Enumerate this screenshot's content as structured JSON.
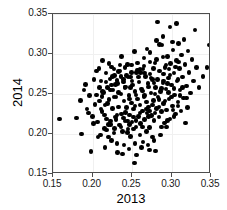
{
  "chart_data": {
    "type": "scatter",
    "title": "",
    "xlabel": "2013",
    "ylabel": "2014",
    "xlim": [
      0.15,
      0.35
    ],
    "ylim": [
      0.15,
      0.35
    ],
    "xticks": [
      "0.15",
      "0.20",
      "0.25",
      "0.30",
      "0.35"
    ],
    "yticks": [
      "0.15",
      "0.20",
      "0.25",
      "0.30",
      "0.35"
    ],
    "xtick_values": [
      0.15,
      0.2,
      0.25,
      0.3,
      0.35
    ],
    "ytick_values": [
      0.15,
      0.2,
      0.25,
      0.3,
      0.35
    ],
    "grid": true,
    "legend": null,
    "marker": "filled-circle",
    "marker_color": "#000000",
    "n_points": 268,
    "points": [
      [
        0.158,
        0.219
      ],
      [
        0.178,
        0.149
      ],
      [
        0.18,
        0.22
      ],
      [
        0.186,
        0.2
      ],
      [
        0.191,
        0.262
      ],
      [
        0.193,
        0.231
      ],
      [
        0.195,
        0.226
      ],
      [
        0.198,
        0.178
      ],
      [
        0.2,
        0.222
      ],
      [
        0.201,
        0.213
      ],
      [
        0.203,
        0.237
      ],
      [
        0.205,
        0.249
      ],
      [
        0.207,
        0.196
      ],
      [
        0.208,
        0.282
      ],
      [
        0.209,
        0.241
      ],
      [
        0.21,
        0.199
      ],
      [
        0.211,
        0.266
      ],
      [
        0.212,
        0.228
      ],
      [
        0.213,
        0.292
      ],
      [
        0.214,
        0.252
      ],
      [
        0.215,
        0.207
      ],
      [
        0.216,
        0.236
      ],
      [
        0.217,
        0.276
      ],
      [
        0.218,
        0.219
      ],
      [
        0.219,
        0.258
      ],
      [
        0.22,
        0.196
      ],
      [
        0.221,
        0.243
      ],
      [
        0.222,
        0.269
      ],
      [
        0.223,
        0.212
      ],
      [
        0.224,
        0.284
      ],
      [
        0.225,
        0.232
      ],
      [
        0.226,
        0.255
      ],
      [
        0.227,
        0.201
      ],
      [
        0.228,
        0.273
      ],
      [
        0.229,
        0.221
      ],
      [
        0.23,
        0.246
      ],
      [
        0.231,
        0.188
      ],
      [
        0.232,
        0.263
      ],
      [
        0.233,
        0.234
      ],
      [
        0.234,
        0.211
      ],
      [
        0.235,
        0.279
      ],
      [
        0.236,
        0.25
      ],
      [
        0.237,
        0.225
      ],
      [
        0.238,
        0.203
      ],
      [
        0.239,
        0.268
      ],
      [
        0.24,
        0.241
      ],
      [
        0.241,
        0.216
      ],
      [
        0.242,
        0.259
      ],
      [
        0.243,
        0.233
      ],
      [
        0.244,
        0.287
      ],
      [
        0.245,
        0.206
      ],
      [
        0.246,
        0.248
      ],
      [
        0.247,
        0.224
      ],
      [
        0.248,
        0.271
      ],
      [
        0.249,
        0.239
      ],
      [
        0.25,
        0.215
      ],
      [
        0.251,
        0.261
      ],
      [
        0.252,
        0.231
      ],
      [
        0.253,
        0.164
      ],
      [
        0.254,
        0.253
      ],
      [
        0.255,
        0.209
      ],
      [
        0.256,
        0.277
      ],
      [
        0.257,
        0.244
      ],
      [
        0.258,
        0.222
      ],
      [
        0.259,
        0.265
      ],
      [
        0.26,
        0.236
      ],
      [
        0.261,
        0.213
      ],
      [
        0.262,
        0.256
      ],
      [
        0.263,
        0.229
      ],
      [
        0.264,
        0.281
      ],
      [
        0.265,
        0.247
      ],
      [
        0.266,
        0.218
      ],
      [
        0.267,
        0.272
      ],
      [
        0.268,
        0.24
      ],
      [
        0.269,
        0.226
      ],
      [
        0.27,
        0.263
      ],
      [
        0.271,
        0.234
      ],
      [
        0.272,
        0.208
      ],
      [
        0.273,
        0.275
      ],
      [
        0.274,
        0.251
      ],
      [
        0.275,
        0.223
      ],
      [
        0.276,
        0.268
      ],
      [
        0.277,
        0.242
      ],
      [
        0.278,
        0.217
      ],
      [
        0.279,
        0.289
      ],
      [
        0.28,
        0.258
      ],
      [
        0.281,
        0.232
      ],
      [
        0.282,
        0.34
      ],
      [
        0.283,
        0.246
      ],
      [
        0.284,
        0.221
      ],
      [
        0.285,
        0.279
      ],
      [
        0.286,
        0.253
      ],
      [
        0.287,
        0.228
      ],
      [
        0.288,
        0.311
      ],
      [
        0.289,
        0.264
      ],
      [
        0.29,
        0.238
      ],
      [
        0.291,
        0.214
      ],
      [
        0.292,
        0.283
      ],
      [
        0.293,
        0.256
      ],
      [
        0.294,
        0.23
      ],
      [
        0.295,
        0.297
      ],
      [
        0.296,
        0.27
      ],
      [
        0.297,
        0.244
      ],
      [
        0.298,
        0.219
      ],
      [
        0.299,
        0.288
      ],
      [
        0.3,
        0.261
      ],
      [
        0.301,
        0.235
      ],
      [
        0.302,
        0.305
      ],
      [
        0.303,
        0.276
      ],
      [
        0.304,
        0.249
      ],
      [
        0.305,
        0.225
      ],
      [
        0.306,
        0.292
      ],
      [
        0.307,
        0.266
      ],
      [
        0.308,
        0.24
      ],
      [
        0.309,
        0.313
      ],
      [
        0.31,
        0.282
      ],
      [
        0.311,
        0.255
      ],
      [
        0.312,
        0.229
      ],
      [
        0.313,
        0.299
      ],
      [
        0.314,
        0.271
      ],
      [
        0.315,
        0.245
      ],
      [
        0.316,
        0.318
      ],
      [
        0.317,
        0.287
      ],
      [
        0.318,
        0.214
      ],
      [
        0.319,
        0.26
      ],
      [
        0.32,
        0.233
      ],
      [
        0.321,
        0.304
      ],
      [
        0.322,
        0.277
      ],
      [
        0.324,
        0.251
      ],
      [
        0.326,
        0.293
      ],
      [
        0.328,
        0.266
      ],
      [
        0.33,
        0.33
      ],
      [
        0.332,
        0.283
      ],
      [
        0.335,
        0.258
      ],
      [
        0.34,
        0.272
      ],
      [
        0.345,
        0.283
      ],
      [
        0.348,
        0.311
      ],
      [
        0.185,
        0.242
      ],
      [
        0.189,
        0.255
      ],
      [
        0.196,
        0.248
      ],
      [
        0.202,
        0.268
      ],
      [
        0.206,
        0.215
      ],
      [
        0.212,
        0.247
      ],
      [
        0.218,
        0.205
      ],
      [
        0.224,
        0.261
      ],
      [
        0.23,
        0.218
      ],
      [
        0.236,
        0.272
      ],
      [
        0.242,
        0.227
      ],
      [
        0.248,
        0.258
      ],
      [
        0.254,
        0.235
      ],
      [
        0.26,
        0.281
      ],
      [
        0.266,
        0.248
      ],
      [
        0.272,
        0.229
      ],
      [
        0.278,
        0.264
      ],
      [
        0.284,
        0.243
      ],
      [
        0.29,
        0.275
      ],
      [
        0.296,
        0.252
      ],
      [
        0.302,
        0.23
      ],
      [
        0.308,
        0.268
      ],
      [
        0.314,
        0.258
      ],
      [
        0.205,
        0.279
      ],
      [
        0.213,
        0.253
      ],
      [
        0.221,
        0.288
      ],
      [
        0.229,
        0.262
      ],
      [
        0.237,
        0.297
      ],
      [
        0.245,
        0.271
      ],
      [
        0.253,
        0.303
      ],
      [
        0.261,
        0.277
      ],
      [
        0.269,
        0.306
      ],
      [
        0.277,
        0.282
      ],
      [
        0.285,
        0.312
      ],
      [
        0.293,
        0.286
      ],
      [
        0.301,
        0.315
      ],
      [
        0.309,
        0.29
      ],
      [
        0.298,
        0.334
      ],
      [
        0.306,
        0.338
      ],
      [
        0.289,
        0.322
      ],
      [
        0.281,
        0.317
      ],
      [
        0.273,
        0.302
      ],
      [
        0.265,
        0.295
      ],
      [
        0.257,
        0.289
      ],
      [
        0.249,
        0.286
      ],
      [
        0.241,
        0.283
      ],
      [
        0.233,
        0.278
      ],
      [
        0.225,
        0.272
      ],
      [
        0.217,
        0.265
      ],
      [
        0.209,
        0.258
      ],
      [
        0.216,
        0.183
      ],
      [
        0.224,
        0.192
      ],
      [
        0.232,
        0.177
      ],
      [
        0.24,
        0.186
      ],
      [
        0.248,
        0.197
      ],
      [
        0.256,
        0.174
      ],
      [
        0.264,
        0.19
      ],
      [
        0.272,
        0.18
      ],
      [
        0.28,
        0.179
      ],
      [
        0.276,
        0.196
      ],
      [
        0.268,
        0.203
      ],
      [
        0.26,
        0.199
      ],
      [
        0.252,
        0.206
      ],
      [
        0.244,
        0.202
      ],
      [
        0.236,
        0.209
      ],
      [
        0.228,
        0.207
      ],
      [
        0.22,
        0.212
      ],
      [
        0.244,
        0.216
      ],
      [
        0.252,
        0.221
      ],
      [
        0.26,
        0.226
      ],
      [
        0.268,
        0.231
      ],
      [
        0.276,
        0.236
      ],
      [
        0.284,
        0.234
      ],
      [
        0.292,
        0.241
      ],
      [
        0.3,
        0.246
      ],
      [
        0.308,
        0.235
      ],
      [
        0.247,
        0.244
      ],
      [
        0.255,
        0.249
      ],
      [
        0.263,
        0.254
      ],
      [
        0.271,
        0.259
      ],
      [
        0.279,
        0.25
      ],
      [
        0.287,
        0.257
      ],
      [
        0.295,
        0.263
      ],
      [
        0.303,
        0.257
      ],
      [
        0.25,
        0.266
      ],
      [
        0.258,
        0.271
      ],
      [
        0.266,
        0.276
      ],
      [
        0.274,
        0.27
      ],
      [
        0.282,
        0.268
      ],
      [
        0.29,
        0.266
      ],
      [
        0.298,
        0.274
      ],
      [
        0.241,
        0.258
      ],
      [
        0.233,
        0.252
      ],
      [
        0.227,
        0.246
      ],
      [
        0.239,
        0.265
      ],
      [
        0.231,
        0.267
      ],
      [
        0.223,
        0.255
      ],
      [
        0.243,
        0.273
      ],
      [
        0.235,
        0.286
      ],
      [
        0.227,
        0.281
      ],
      [
        0.249,
        0.277
      ],
      [
        0.257,
        0.28
      ],
      [
        0.265,
        0.285
      ],
      [
        0.273,
        0.29
      ],
      [
        0.281,
        0.293
      ],
      [
        0.289,
        0.296
      ],
      [
        0.297,
        0.281
      ],
      [
        0.305,
        0.284
      ],
      [
        0.219,
        0.238
      ],
      [
        0.211,
        0.231
      ],
      [
        0.215,
        0.224
      ],
      [
        0.223,
        0.216
      ],
      [
        0.231,
        0.224
      ],
      [
        0.239,
        0.22
      ],
      [
        0.247,
        0.212
      ],
      [
        0.255,
        0.217
      ],
      [
        0.263,
        0.209
      ],
      [
        0.271,
        0.222
      ],
      [
        0.279,
        0.226
      ],
      [
        0.287,
        0.209
      ],
      [
        0.295,
        0.217
      ],
      [
        0.303,
        0.222
      ],
      [
        0.311,
        0.248
      ],
      [
        0.319,
        0.245
      ],
      [
        0.294,
        0.209
      ],
      [
        0.286,
        0.199
      ],
      [
        0.278,
        0.192
      ],
      [
        0.27,
        0.186
      ],
      [
        0.262,
        0.183
      ],
      [
        0.254,
        0.188
      ],
      [
        0.246,
        0.181
      ],
      [
        0.238,
        0.175
      ]
    ]
  }
}
